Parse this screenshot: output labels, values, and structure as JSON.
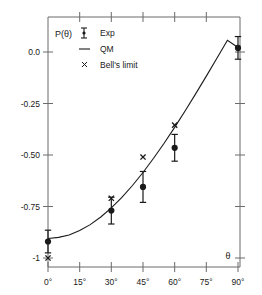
{
  "chart_data": {
    "type": "scatter",
    "title": "",
    "xlabel": "θ",
    "ylabel": "P(θ)",
    "xlim": [
      0,
      90
    ],
    "ylim": [
      -1.0,
      0.08
    ],
    "grid": false,
    "legend_position": "top-left",
    "x_tick_labels": [
      "0°",
      "15°",
      "30°",
      "45°",
      "60°",
      "75°",
      "90°"
    ],
    "x_tick_values": [
      0,
      15,
      30,
      45,
      60,
      75,
      90
    ],
    "y_tick_labels": [
      "0.0",
      "-0.25",
      "-0.50",
      "-0.75",
      "-1"
    ],
    "y_tick_values": [
      0.0,
      -0.25,
      -0.5,
      -0.75,
      -1.0
    ],
    "series": [
      {
        "name": "Exp",
        "marker": "filled-circle-with-errorbars",
        "x": [
          0,
          30,
          45,
          60,
          90
        ],
        "values": [
          -0.92,
          -0.77,
          -0.655,
          -0.465,
          0.02
        ],
        "yerr": [
          0.055,
          0.065,
          0.075,
          0.065,
          0.055
        ]
      },
      {
        "name": "QM",
        "marker": "line",
        "x": [
          0,
          5,
          10,
          15,
          20,
          25,
          30,
          35,
          40,
          45,
          50,
          55,
          60,
          65,
          70,
          75,
          80,
          85,
          90
        ],
        "values": [
          -0.905,
          -0.9,
          -0.888,
          -0.867,
          -0.838,
          -0.801,
          -0.757,
          -0.706,
          -0.648,
          -0.585,
          -0.516,
          -0.443,
          -0.366,
          -0.285,
          -0.202,
          -0.117,
          -0.03,
          0.057,
          0.022
        ]
      },
      {
        "name": "Bell's limit",
        "marker": "x-cross",
        "x": [
          0,
          30,
          45,
          60
        ],
        "values": [
          -1.0,
          -0.71,
          -0.51,
          -0.355
        ]
      }
    ]
  },
  "legend": {
    "items": [
      {
        "label": "Exp",
        "symbol": "errorbar"
      },
      {
        "label": "QM",
        "symbol": "line"
      },
      {
        "label": "Bell's limit",
        "symbol": "cross"
      }
    ]
  },
  "axes": {
    "y_title": "P(θ)",
    "x_title": "θ"
  },
  "colors": {
    "ink": "#1a1a1a",
    "axis": "#555555",
    "background": "#ffffff"
  }
}
